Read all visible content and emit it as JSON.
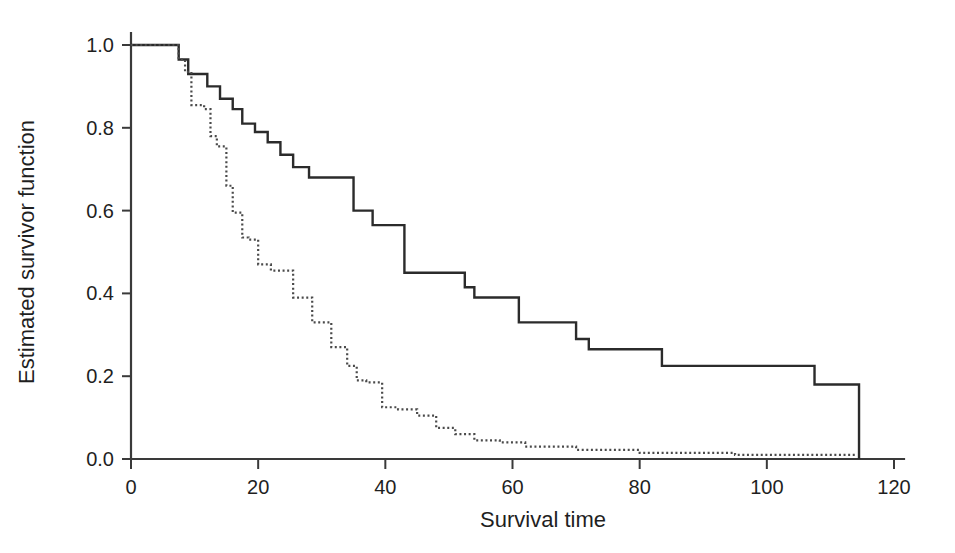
{
  "chart_data": {
    "type": "line",
    "title": "",
    "subtitle": "",
    "xlabel": "Survival time",
    "ylabel": "Estimated survivor function",
    "xlim": [
      0,
      120
    ],
    "ylim": [
      0.0,
      1.0
    ],
    "grid": false,
    "legend": "none",
    "x_ticks": [
      0,
      20,
      40,
      60,
      80,
      100,
      120
    ],
    "x_tick_labels": [
      "0",
      "20",
      "40",
      "60",
      "80",
      "100",
      "120"
    ],
    "y_ticks": [
      0.0,
      0.2,
      0.4,
      0.6,
      0.8,
      1.0
    ],
    "y_tick_labels": [
      "0.0",
      "0.2",
      "0.4",
      "0.6",
      "0.8",
      "1.0"
    ],
    "interpolation": "step-post",
    "series": [
      {
        "name": "solid-curve",
        "style": "solid",
        "color": "#2b2b2b",
        "x": [
          0,
          6,
          7.5,
          9,
          10.5,
          12,
          14,
          16,
          17.5,
          19.5,
          21.5,
          23.5,
          25.5,
          28,
          33.5,
          35,
          36.5,
          38,
          43,
          49,
          52.5,
          54,
          61,
          67.5,
          70,
          72,
          83.5,
          107.5,
          114.5,
          114.5
        ],
        "y": [
          1.0,
          1.0,
          0.965,
          0.93,
          0.93,
          0.9,
          0.87,
          0.845,
          0.81,
          0.79,
          0.765,
          0.735,
          0.705,
          0.68,
          0.68,
          0.6,
          0.6,
          0.565,
          0.45,
          0.45,
          0.415,
          0.39,
          0.33,
          0.33,
          0.29,
          0.265,
          0.225,
          0.18,
          0.12,
          0.0
        ]
      },
      {
        "name": "dotted-curve",
        "style": "dotted",
        "color": "#4a4a4a",
        "x": [
          0,
          6.5,
          7.5,
          8.5,
          9.5,
          11.5,
          12.5,
          13.5,
          15,
          16,
          17.5,
          18.5,
          20,
          22,
          25.5,
          28.5,
          31.5,
          34,
          35.5,
          37,
          39.5,
          42,
          45,
          48,
          51,
          54,
          58,
          62,
          70,
          80,
          95,
          114
        ],
        "y": [
          1.0,
          1.0,
          0.965,
          0.935,
          0.855,
          0.845,
          0.78,
          0.755,
          0.66,
          0.595,
          0.535,
          0.53,
          0.47,
          0.455,
          0.39,
          0.33,
          0.27,
          0.225,
          0.19,
          0.185,
          0.125,
          0.12,
          0.105,
          0.075,
          0.06,
          0.045,
          0.04,
          0.03,
          0.022,
          0.015,
          0.01,
          0.008
        ]
      }
    ]
  },
  "axes": {
    "x_title": "Survival time",
    "y_title": "Estimated survivor function"
  },
  "colors": {
    "background": "#ffffff",
    "axis": "#3a3a3a",
    "solid_series": "#2b2b2b",
    "dotted_series": "#4a4a4a",
    "text": "#1f1f1f"
  }
}
